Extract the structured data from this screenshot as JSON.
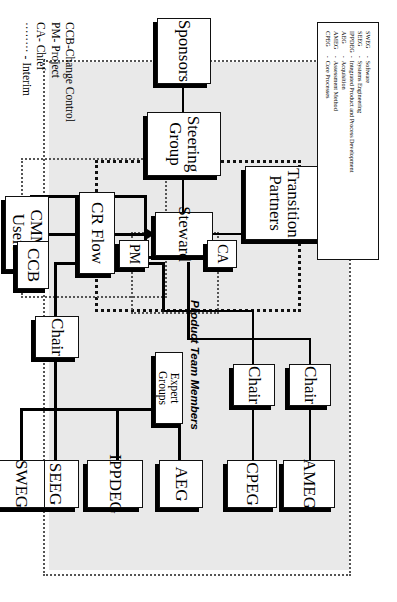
{
  "diagram": {
    "nodes": {
      "sponsors": "Sponsors",
      "steering_group": "Steering Group",
      "steward": "Steward",
      "ca": "CA",
      "pm": "PM",
      "transition_partners_l1": "Transition",
      "transition_partners_l2": "Partners",
      "cmmi_users_l1": "CMMI",
      "cmmi_users_l2": "Users",
      "cr_flow": "CR Flow",
      "ccb": "CCB",
      "chair_1": "Chair",
      "chair_2": "Chair",
      "chair_3": "Chair",
      "sweg": "SWEG",
      "seeg": "SEEG",
      "ippdeg": "IPPDEG",
      "aeg": "AEG",
      "cpeg": "CPEG",
      "ameg": "AMEG",
      "expert_groups": "Expert Groups"
    },
    "panel_label": "Product Team Members",
    "legend": {
      "rows": [
        {
          "abbr": "SWEG",
          "dash": "-",
          "desc": "Software"
        },
        {
          "abbr": "SEEG",
          "dash": "-",
          "desc": "Systems Engineering"
        },
        {
          "abbr": "IPPDEG",
          "dash": "-",
          "desc": "Integrated Product and Process Development"
        },
        {
          "abbr": "AEG",
          "dash": "-",
          "desc": "Acquisition"
        },
        {
          "abbr": "AMEG",
          "dash": "-",
          "desc": "Assessment Method"
        },
        {
          "abbr": "CPEG",
          "dash": "-",
          "desc": "Core Processes"
        }
      ]
    },
    "abbrev_key": [
      "CCB-Change Control",
      "PM- Project",
      "CA- Chief",
      "········ - Interim"
    ],
    "colors": {
      "panel_fill": "#e9e9e9",
      "box_fill": "#ffffff",
      "stroke": "#111111",
      "shadow": "#000000"
    }
  }
}
